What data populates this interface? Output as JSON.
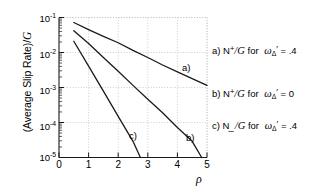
{
  "chart_data": {
    "type": "line",
    "title": "",
    "xlabel": "ρ",
    "ylabel": "(Average Slip Rate)/G",
    "xlim": [
      0,
      5
    ],
    "ylim": [
      1e-05,
      0.1
    ],
    "yscale": "log",
    "xscale": "linear",
    "grid": true,
    "legend_position": "right-outside",
    "xticks": [
      "0",
      "1",
      "2",
      "3",
      "4",
      "5"
    ],
    "xtick_values": [
      0,
      1,
      2,
      3,
      4,
      5
    ],
    "yticks": [
      "10-1",
      "10-2",
      "10-3",
      "10-4",
      "10-5"
    ],
    "ytick_values": [
      0.1,
      0.01,
      0.001,
      0.0001,
      1e-05
    ],
    "series": [
      {
        "name": "a",
        "tag": "a)",
        "legend": "a) N+/G for  ωΔ' = .4",
        "color": "#1a1a1a",
        "x": [
          0.5,
          1.0,
          1.5,
          2.0,
          2.5,
          3.0,
          3.5,
          4.0,
          4.5,
          5.0
        ],
        "y": [
          0.072,
          0.045,
          0.029,
          0.019,
          0.0115,
          0.0072,
          0.0044,
          0.0028,
          0.0018,
          0.00115
        ]
      },
      {
        "name": "b",
        "tag": "b)",
        "legend": "b) N+/G for  ωΔ' = 0",
        "color": "#1a1a1a",
        "x": [
          0.5,
          1.0,
          1.5,
          2.0,
          2.5,
          3.0,
          3.5,
          4.0,
          4.5,
          4.82
        ],
        "y": [
          0.042,
          0.018,
          0.0072,
          0.0029,
          0.00115,
          0.00046,
          0.00019,
          7.2e-05,
          2.9e-05,
          1e-05
        ]
      },
      {
        "name": "c",
        "tag": "c)",
        "legend": "c) N_/G for  ωΔ' = .4",
        "color": "#1a1a1a",
        "x": [
          0.5,
          1.0,
          1.5,
          2.0,
          2.5,
          2.75
        ],
        "y": [
          0.021,
          0.0041,
          0.00079,
          0.00015,
          2.9e-05,
          1e-05
        ]
      }
    ]
  },
  "axes": {
    "ylabel_main": "(Average Slip Rate)/",
    "ylabel_italic": "G",
    "xlabel": "ρ",
    "yticks": [
      {
        "mantissa": "10",
        "exp": "-1"
      },
      {
        "mantissa": "10",
        "exp": "-2"
      },
      {
        "mantissa": "10",
        "exp": "-3"
      },
      {
        "mantissa": "10",
        "exp": "-4"
      },
      {
        "mantissa": "10",
        "exp": "-5"
      }
    ],
    "xticks": [
      "0",
      "1",
      "2",
      "3",
      "4",
      "5"
    ]
  },
  "curve_tags": [
    {
      "label": "a)",
      "left": 182,
      "top": 63
    },
    {
      "label": "b)",
      "left": 186,
      "top": 133
    },
    {
      "label": "c)",
      "left": 129,
      "top": 131
    }
  ],
  "legend": {
    "rows": [
      {
        "top": 45,
        "prefix": "a)",
        "symbol": "N",
        "sign": "+",
        "over": "/",
        "denom": "G",
        "for": "for",
        "omega": "ω",
        "sub": "Δ",
        "prime": "′",
        "eq": "= .4"
      },
      {
        "top": 88,
        "prefix": "b)",
        "symbol": "N",
        "sign": "+",
        "over": "/",
        "denom": "G",
        "for": "for",
        "omega": "ω",
        "sub": "Δ",
        "prime": "′",
        "eq": "= 0"
      },
      {
        "top": 120,
        "prefix": "c)",
        "symbol": "N",
        "sign": "_",
        "over": "/",
        "denom": "G",
        "for": "for",
        "omega": "ω",
        "sub": "Δ",
        "prime": "′",
        "eq": "= .4"
      }
    ]
  }
}
